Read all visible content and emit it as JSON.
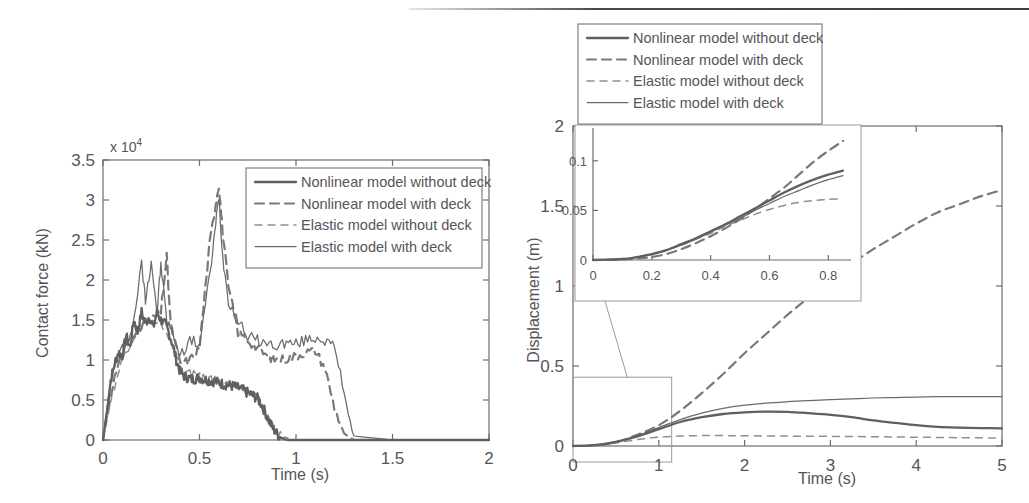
{
  "figure": {
    "name": "two-panel-time-history-figure",
    "background": "#ffffff",
    "ink_color": "#5a5a5a"
  },
  "legend_entries": [
    {
      "label": "Nonlinear model without deck",
      "style": "solid-thick",
      "key": "nl_wo"
    },
    {
      "label": "Nonlinear model with deck",
      "style": "dashed-thick",
      "key": "nl_w"
    },
    {
      "label": "Elastic model without deck",
      "style": "dashed-thin",
      "key": "el_wo"
    },
    {
      "label": "Elastic model with deck",
      "style": "solid-thin",
      "key": "el_w"
    }
  ],
  "chart_data": [
    {
      "type": "line",
      "name": "contact-force-chart",
      "title": "",
      "xlabel": "Time (s)",
      "ylabel": "Contact force (kN)",
      "y_multiplier": "x 10",
      "y_multiplier_exponent": "4",
      "xlim": [
        0,
        2
      ],
      "ylim": [
        0,
        3.5
      ],
      "xticks": [
        0,
        0.5,
        1,
        1.5,
        2
      ],
      "xticklabels": [
        "0",
        "0.5",
        "1",
        "1.5",
        "2"
      ],
      "yticks": [
        0,
        0.5,
        1,
        1.5,
        2,
        2.5,
        3,
        3.5
      ],
      "yticklabels": [
        "0",
        "0.5",
        "1",
        "1.5",
        "2",
        "2.5",
        "3",
        "3.5"
      ],
      "grid": false,
      "legend_position": "top-right-inside",
      "series": [
        {
          "name": "Nonlinear model without deck",
          "key": "nl_wo",
          "x": [
            0,
            0.02,
            0.04,
            0.06,
            0.08,
            0.1,
            0.12,
            0.14,
            0.16,
            0.18,
            0.2,
            0.22,
            0.24,
            0.26,
            0.28,
            0.3,
            0.32,
            0.34,
            0.36,
            0.38,
            0.4,
            0.42,
            0.44,
            0.46,
            0.48,
            0.5,
            0.52,
            0.54,
            0.56,
            0.58,
            0.6,
            0.62,
            0.64,
            0.66,
            0.68,
            0.7,
            0.72,
            0.74,
            0.76,
            0.78,
            0.8,
            0.82,
            0.84,
            0.86,
            0.88,
            0.9,
            0.92,
            0.94,
            0.96,
            1.0,
            1.2,
            1.5,
            2.0
          ],
          "y": [
            0,
            0.35,
            0.75,
            0.95,
            1.1,
            1.05,
            1.3,
            1.15,
            1.5,
            1.35,
            1.6,
            1.45,
            1.55,
            1.4,
            1.6,
            1.5,
            1.45,
            1.35,
            1.2,
            1.0,
            0.85,
            0.8,
            0.78,
            0.76,
            0.77,
            0.78,
            0.76,
            0.75,
            0.74,
            0.73,
            0.72,
            0.7,
            0.69,
            0.68,
            0.67,
            0.65,
            0.63,
            0.6,
            0.58,
            0.55,
            0.52,
            0.45,
            0.35,
            0.24,
            0.15,
            0.08,
            0.03,
            0.01,
            0,
            0,
            0,
            0,
            0
          ]
        },
        {
          "name": "Nonlinear model with deck",
          "key": "nl_w",
          "x": [
            0,
            0.02,
            0.05,
            0.1,
            0.12,
            0.15,
            0.2,
            0.25,
            0.3,
            0.33,
            0.35,
            0.4,
            0.45,
            0.5,
            0.55,
            0.58,
            0.6,
            0.62,
            0.65,
            0.7,
            0.75,
            0.8,
            0.85,
            0.9,
            0.95,
            1.0,
            1.05,
            1.1,
            1.15,
            1.2,
            1.25,
            1.3,
            1.5,
            2.0
          ],
          "y": [
            0,
            0.3,
            0.7,
            1.05,
            1.2,
            1.25,
            1.45,
            1.5,
            1.6,
            2.3,
            1.45,
            0.95,
            1.0,
            1.15,
            2.4,
            2.9,
            3.2,
            2.6,
            1.9,
            1.35,
            1.25,
            1.15,
            1.05,
            1.0,
            1.02,
            1.05,
            1.1,
            1.12,
            0.9,
            0.4,
            0.08,
            0,
            0,
            0
          ]
        },
        {
          "name": "Elastic model without deck",
          "key": "el_wo",
          "x": [
            0,
            0.05,
            0.1,
            0.15,
            0.2,
            0.25,
            0.3,
            0.35,
            0.4,
            0.45,
            0.5,
            0.55,
            0.6,
            0.65,
            0.7,
            0.75,
            0.8,
            0.82,
            0.85,
            0.88,
            0.9,
            0.95,
            1.0,
            1.5,
            2.0
          ],
          "y": [
            0,
            0.6,
            1.0,
            1.2,
            1.45,
            1.5,
            1.45,
            1.25,
            0.9,
            0.85,
            0.8,
            0.78,
            0.75,
            0.72,
            0.68,
            0.62,
            0.55,
            0.45,
            0.3,
            0.16,
            0.1,
            0.03,
            0,
            0,
            0
          ]
        },
        {
          "name": "Elastic model with deck",
          "key": "el_w",
          "x": [
            0,
            0.02,
            0.05,
            0.1,
            0.15,
            0.2,
            0.22,
            0.25,
            0.28,
            0.3,
            0.33,
            0.36,
            0.4,
            0.45,
            0.5,
            0.55,
            0.58,
            0.6,
            0.62,
            0.65,
            0.7,
            0.75,
            0.8,
            0.85,
            0.9,
            0.95,
            1.0,
            1.05,
            1.1,
            1.15,
            1.2,
            1.25,
            1.3,
            1.5,
            2.0
          ],
          "y": [
            0,
            0.4,
            0.85,
            1.15,
            1.35,
            2.2,
            1.75,
            2.25,
            1.6,
            2.2,
            1.5,
            1.35,
            1.05,
            1.25,
            1.2,
            2.0,
            2.6,
            3.05,
            2.3,
            1.75,
            1.5,
            1.3,
            1.25,
            1.2,
            1.18,
            1.22,
            1.2,
            1.25,
            1.28,
            1.25,
            1.15,
            0.6,
            0.05,
            0,
            0
          ]
        }
      ]
    },
    {
      "type": "line",
      "name": "displacement-chart",
      "title": "",
      "xlabel": "Time (s)",
      "ylabel": "Displacement (m)",
      "xlim": [
        0,
        5
      ],
      "ylim": [
        0,
        2
      ],
      "xticks": [
        0,
        1,
        2,
        3,
        4,
        5
      ],
      "xticklabels": [
        "0",
        "1",
        "2",
        "3",
        "4",
        "5"
      ],
      "yticks": [
        0,
        0.5,
        1,
        1.5,
        2
      ],
      "yticklabels": [
        "0",
        "0.5",
        "1",
        "1.5",
        "2"
      ],
      "grid": false,
      "legend_position": "above-axes",
      "series": [
        {
          "name": "Nonlinear model without deck",
          "key": "nl_wo",
          "x": [
            0,
            0.25,
            0.5,
            0.75,
            1.0,
            1.25,
            1.5,
            1.75,
            2.0,
            2.25,
            2.5,
            2.75,
            3.0,
            3.25,
            3.5,
            3.75,
            4.0,
            4.25,
            4.5,
            4.75,
            5.0
          ],
          "y": [
            0,
            0.005,
            0.025,
            0.06,
            0.105,
            0.15,
            0.18,
            0.2,
            0.21,
            0.215,
            0.213,
            0.205,
            0.195,
            0.18,
            0.16,
            0.145,
            0.13,
            0.12,
            0.115,
            0.112,
            0.11
          ]
        },
        {
          "name": "Nonlinear model with deck",
          "key": "nl_w",
          "x": [
            0,
            0.25,
            0.5,
            0.75,
            1.0,
            1.25,
            1.5,
            1.75,
            2.0,
            2.25,
            2.5,
            2.75,
            3.0,
            3.25,
            3.5,
            3.75,
            4.0,
            4.25,
            4.5,
            4.75,
            5.0
          ],
          "y": [
            0,
            0.005,
            0.025,
            0.07,
            0.13,
            0.22,
            0.33,
            0.45,
            0.58,
            0.7,
            0.82,
            0.93,
            1.04,
            1.14,
            1.23,
            1.31,
            1.39,
            1.46,
            1.51,
            1.56,
            1.6
          ]
        },
        {
          "name": "Elastic model without deck",
          "key": "el_wo",
          "x": [
            0,
            0.25,
            0.5,
            0.75,
            1.0,
            1.25,
            1.5,
            1.75,
            2.0,
            2.5,
            3.0,
            3.5,
            4.0,
            4.5,
            5.0
          ],
          "y": [
            0,
            0.004,
            0.02,
            0.04,
            0.055,
            0.062,
            0.065,
            0.065,
            0.064,
            0.062,
            0.06,
            0.058,
            0.055,
            0.052,
            0.05
          ]
        },
        {
          "name": "Elastic model with deck",
          "key": "el_w",
          "x": [
            0,
            0.25,
            0.5,
            0.75,
            1.0,
            1.25,
            1.5,
            1.75,
            2.0,
            2.25,
            2.5,
            2.75,
            3.0,
            3.25,
            3.5,
            3.75,
            4.0,
            4.25,
            4.5,
            4.75,
            5.0
          ],
          "y": [
            0,
            0.005,
            0.025,
            0.065,
            0.115,
            0.165,
            0.205,
            0.235,
            0.255,
            0.268,
            0.277,
            0.284,
            0.29,
            0.295,
            0.3,
            0.303,
            0.306,
            0.308,
            0.309,
            0.309,
            0.308
          ]
        }
      ],
      "zoom_box": {
        "x0": 0,
        "x1": 1.15,
        "y0": -0.1,
        "y1": 0.43
      },
      "inset": {
        "type": "line",
        "name": "displacement-inset-chart",
        "xlim": [
          0,
          0.85
        ],
        "ylim": [
          0,
          0.125
        ],
        "xticks": [
          0,
          0.2,
          0.4,
          0.6,
          0.8
        ],
        "xticklabels": [
          "0",
          "0.2",
          "0.4",
          "0.6",
          "0.8"
        ],
        "yticks": [
          0,
          0.05,
          0.1
        ],
        "yticklabels": [
          "0",
          "0.05",
          "0.1"
        ],
        "series": [
          {
            "name": "Nonlinear model without deck",
            "key": "nl_wo",
            "x": [
              0,
              0.1,
              0.15,
              0.2,
              0.25,
              0.3,
              0.35,
              0.4,
              0.45,
              0.5,
              0.55,
              0.6,
              0.65,
              0.7,
              0.75,
              0.8,
              0.85
            ],
            "y": [
              0,
              0.001,
              0.003,
              0.006,
              0.01,
              0.016,
              0.022,
              0.029,
              0.036,
              0.044,
              0.052,
              0.06,
              0.068,
              0.075,
              0.081,
              0.086,
              0.09
            ]
          },
          {
            "name": "Nonlinear model with deck",
            "key": "nl_w",
            "x": [
              0,
              0.1,
              0.15,
              0.2,
              0.25,
              0.3,
              0.35,
              0.4,
              0.45,
              0.5,
              0.55,
              0.6,
              0.65,
              0.7,
              0.75,
              0.8,
              0.85
            ],
            "y": [
              0,
              0.0005,
              0.0015,
              0.003,
              0.006,
              0.011,
              0.017,
              0.024,
              0.032,
              0.041,
              0.051,
              0.062,
              0.073,
              0.086,
              0.099,
              0.11,
              0.12
            ]
          },
          {
            "name": "Elastic model without deck",
            "key": "el_wo",
            "x": [
              0,
              0.1,
              0.15,
              0.2,
              0.25,
              0.3,
              0.35,
              0.4,
              0.45,
              0.5,
              0.55,
              0.6,
              0.65,
              0.7,
              0.75,
              0.8,
              0.85
            ],
            "y": [
              0,
              0.001,
              0.003,
              0.006,
              0.01,
              0.015,
              0.021,
              0.027,
              0.034,
              0.04,
              0.046,
              0.051,
              0.055,
              0.058,
              0.06,
              0.061,
              0.062
            ]
          },
          {
            "name": "Elastic model with deck",
            "key": "el_w",
            "x": [
              0,
              0.1,
              0.15,
              0.2,
              0.25,
              0.3,
              0.35,
              0.4,
              0.45,
              0.5,
              0.55,
              0.6,
              0.65,
              0.7,
              0.75,
              0.8,
              0.85
            ],
            "y": [
              0,
              0.001,
              0.003,
              0.006,
              0.01,
              0.015,
              0.021,
              0.028,
              0.035,
              0.042,
              0.05,
              0.057,
              0.064,
              0.07,
              0.076,
              0.081,
              0.085
            ]
          }
        ]
      }
    }
  ]
}
